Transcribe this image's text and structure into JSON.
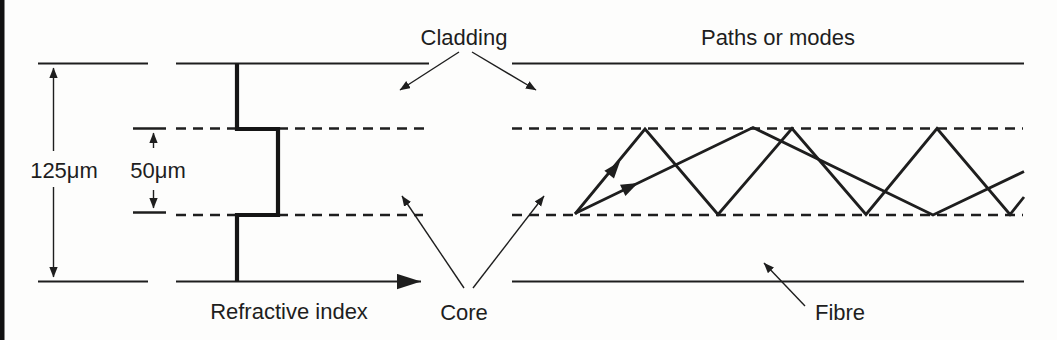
{
  "figure": {
    "labels": {
      "cladding": "Cladding",
      "paths_or_modes": "Paths or modes",
      "core": "Core",
      "fibre": "Fibre",
      "refractive_index": "Refractive index"
    },
    "dimensions": {
      "cladding_diameter": "125μm",
      "core_diameter": "50μm"
    },
    "colors": {
      "ink": "#1e1e1e",
      "paper": "#fdfdfc",
      "scan_edge_bar": "#111111"
    }
  }
}
